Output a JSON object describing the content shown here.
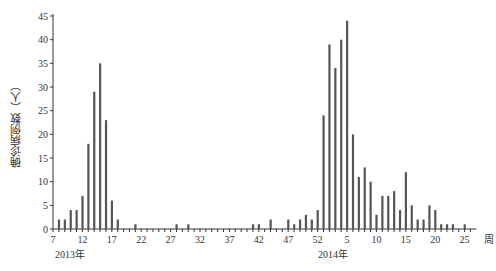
{
  "chart_data": {
    "type": "bar",
    "title": "",
    "xlabel": "周",
    "ylabel": "确诊病例数（人）",
    "ylim": [
      0,
      45
    ],
    "yticks": [
      0,
      5,
      10,
      15,
      20,
      25,
      30,
      35,
      40,
      45
    ],
    "xtick_labels": [
      "7",
      "12",
      "17",
      "22",
      "27",
      "32",
      "37",
      "42",
      "47",
      "52",
      "5",
      "10",
      "15",
      "20",
      "25"
    ],
    "year_labels": [
      {
        "label": "2013年",
        "at_week_index": 0
      },
      {
        "label": "2014年",
        "at_week_index": 48
      }
    ],
    "grid": false,
    "legend": null,
    "categories": [
      "2013-7",
      "2013-8",
      "2013-9",
      "2013-10",
      "2013-11",
      "2013-12",
      "2013-13",
      "2013-14",
      "2013-15",
      "2013-16",
      "2013-17",
      "2013-18",
      "2013-19",
      "2013-20",
      "2013-21",
      "2013-22",
      "2013-23",
      "2013-24",
      "2013-25",
      "2013-26",
      "2013-27",
      "2013-28",
      "2013-29",
      "2013-30",
      "2013-31",
      "2013-32",
      "2013-33",
      "2013-34",
      "2013-35",
      "2013-36",
      "2013-37",
      "2013-38",
      "2013-39",
      "2013-40",
      "2013-41",
      "2013-42",
      "2013-43",
      "2013-44",
      "2013-45",
      "2013-46",
      "2013-47",
      "2013-48",
      "2013-49",
      "2013-50",
      "2013-51",
      "2013-52",
      "2014-1",
      "2014-2",
      "2014-3",
      "2014-4",
      "2014-5",
      "2014-6",
      "2014-7",
      "2014-8",
      "2014-9",
      "2014-10",
      "2014-11",
      "2014-12",
      "2014-13",
      "2014-14",
      "2014-15",
      "2014-16",
      "2014-17",
      "2014-18",
      "2014-19",
      "2014-20",
      "2014-21",
      "2014-22",
      "2014-23",
      "2014-24",
      "2014-25",
      "2014-26"
    ],
    "values": [
      0,
      2,
      2,
      4,
      4,
      7,
      18,
      29,
      35,
      23,
      6,
      2,
      0,
      0,
      1,
      0,
      0,
      0,
      0,
      0,
      0,
      1,
      0,
      1,
      0,
      0,
      0,
      0,
      0,
      0,
      0,
      0,
      0,
      0,
      1,
      1,
      0,
      2,
      0,
      0,
      2,
      1,
      2,
      3,
      2,
      4,
      24,
      39,
      34,
      40,
      44,
      20,
      11,
      13,
      10,
      3,
      7,
      7,
      8,
      4,
      12,
      5,
      2,
      2,
      5,
      4,
      1,
      1,
      1,
      0,
      1,
      0
    ]
  },
  "labels": {
    "ylabel": "确诊病例数（人）",
    "xunit": "周",
    "year2013": "2013年",
    "year2014": "2014年"
  }
}
